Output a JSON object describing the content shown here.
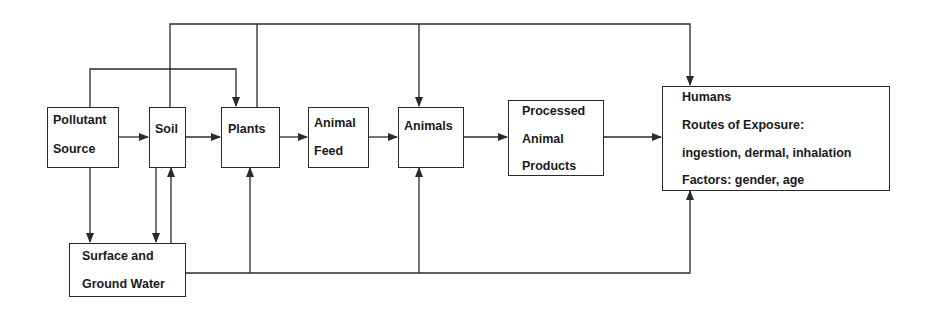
{
  "diagram": {
    "type": "flowchart",
    "title": "",
    "nodes": {
      "pollutant_source": {
        "lines": [
          "Pollutant",
          "Source"
        ]
      },
      "soil": {
        "lines": [
          "Soil"
        ]
      },
      "plants": {
        "lines": [
          "Plants"
        ]
      },
      "animal_feed": {
        "lines": [
          "Animal",
          "Feed"
        ]
      },
      "animals": {
        "lines": [
          "Animals"
        ]
      },
      "processed_animal_products": {
        "lines": [
          "Processed",
          "Animal",
          "Products"
        ]
      },
      "humans": {
        "lines": [
          "Humans",
          "Routes of Exposure:",
          "ingestion, dermal, inhalation",
          "Factors:  gender, age"
        ]
      },
      "surface_ground_water": {
        "lines": [
          "Surface and",
          "Ground Water"
        ]
      }
    },
    "edges": [
      {
        "from": "Pollutant Source",
        "to": "Soil"
      },
      {
        "from": "Soil",
        "to": "Plants"
      },
      {
        "from": "Plants",
        "to": "Animal Feed"
      },
      {
        "from": "Animal Feed",
        "to": "Animals"
      },
      {
        "from": "Animals",
        "to": "Processed Animal Products"
      },
      {
        "from": "Processed Animal Products",
        "to": "Humans"
      },
      {
        "from": "Pollutant Source",
        "to": "Plants"
      },
      {
        "from": "Pollutant Source",
        "to": "Surface and Ground Water"
      },
      {
        "from": "Soil",
        "to": "Surface and Ground Water"
      },
      {
        "from": "Surface and Ground Water",
        "to": "Soil"
      },
      {
        "from": "Surface and Ground Water",
        "to": "Plants"
      },
      {
        "from": "Surface and Ground Water",
        "to": "Animals"
      },
      {
        "from": "Surface and Ground Water",
        "to": "Humans"
      },
      {
        "from": "Soil",
        "to": "Animals"
      },
      {
        "from": "Soil",
        "to": "Humans"
      },
      {
        "from": "Plants",
        "to": "Animals"
      },
      {
        "from": "Plants",
        "to": "Humans"
      }
    ],
    "colors": {
      "line": "#2a2a2a",
      "text": "#1a1a1a",
      "background": "#ffffff"
    }
  }
}
